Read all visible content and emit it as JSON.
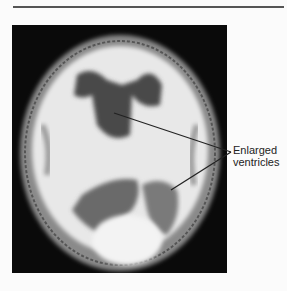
{
  "figure": {
    "annotation": {
      "line1": "Enlarged",
      "line2": "ventricles"
    },
    "image": "axial brain MRI scan",
    "colors": {
      "background": "#fbfbfb",
      "scan_bg": "#0a0a0a",
      "rule": "#555555"
    }
  }
}
